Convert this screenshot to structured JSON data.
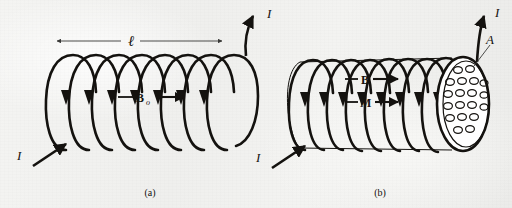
{
  "figure": {
    "caption_a": "(a)",
    "caption_b": "(b)",
    "panel_a": {
      "length_label": "ℓ",
      "field_label": "B",
      "field_label_sub": "o",
      "current_in_label": "I",
      "current_out_label": "I",
      "turns": 8
    },
    "panel_b": {
      "field_label": "B",
      "magnetization_label": "M",
      "area_label": "A",
      "current_in_label": "I",
      "current_out_label": "I",
      "turns": 9,
      "dipole_count": 19
    }
  },
  "colors": {
    "ink": "#14120f",
    "paper": "#f2f2f0",
    "dipole_stroke": "#14120f",
    "endcap_fill": "#ffffff"
  }
}
